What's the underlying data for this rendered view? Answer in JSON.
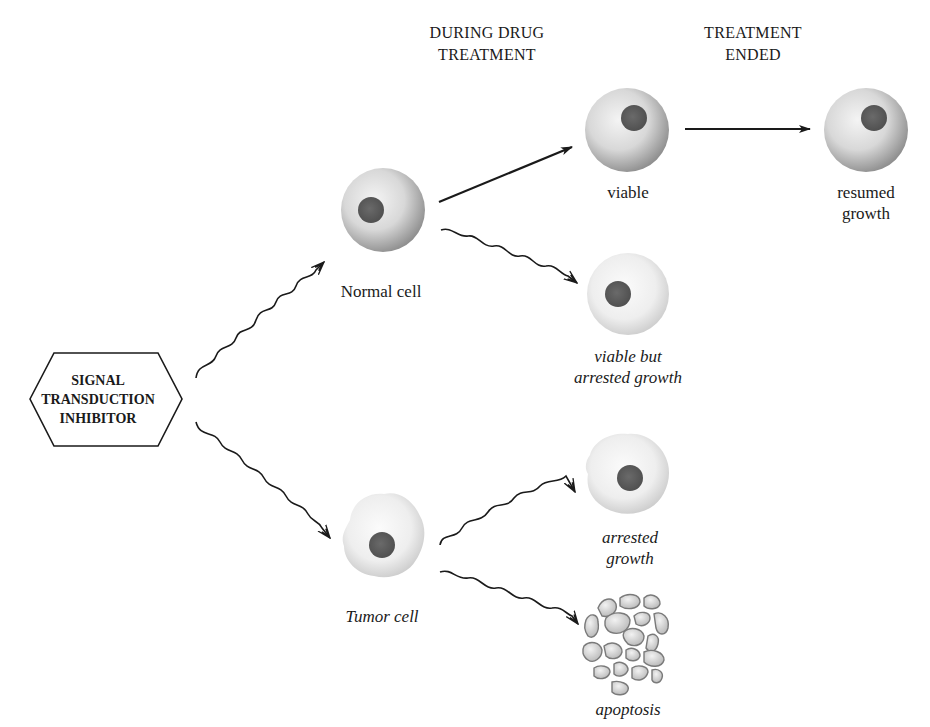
{
  "headers": {
    "during": [
      "DURING DRUG",
      "TREATMENT"
    ],
    "ended": [
      "TREATMENT",
      "ENDED"
    ]
  },
  "inhibitor": {
    "lines": [
      "SIGNAL",
      "TRANSDUCTION",
      "INHIBITOR"
    ]
  },
  "cells": {
    "normal": {
      "label": "Normal cell",
      "style": "upright"
    },
    "tumor": {
      "label": "Tumor cell",
      "style": "italic"
    },
    "viable": {
      "label": "viable",
      "style": "upright"
    },
    "resumed": {
      "label_lines": [
        "resumed",
        "growth"
      ],
      "style": "upright"
    },
    "viable_arrested": {
      "label_lines": [
        "viable but",
        "arrested growth"
      ],
      "style": "italic"
    },
    "tumor_arrested": {
      "label_lines": [
        "arrested",
        "growth"
      ],
      "style": "italic"
    },
    "apoptosis": {
      "label": "apoptosis",
      "style": "italic"
    }
  },
  "arrows": [
    {
      "from": "inhibitor",
      "to": "normal",
      "type": "wavy"
    },
    {
      "from": "inhibitor",
      "to": "tumor",
      "type": "wavy"
    },
    {
      "from": "normal",
      "to": "viable",
      "type": "straight"
    },
    {
      "from": "normal",
      "to": "viable_arrested",
      "type": "wavy"
    },
    {
      "from": "viable",
      "to": "resumed",
      "type": "straight"
    },
    {
      "from": "tumor",
      "to": "tumor_arrested",
      "type": "wavy"
    },
    {
      "from": "tumor",
      "to": "apoptosis",
      "type": "wavy"
    }
  ],
  "colors": {
    "cell_normal_edge": "#8a8a8a",
    "cell_normal_center": "#f2f2f2",
    "cell_pale_edge": "#cfcfcf",
    "nucleus": "#5a5a5a",
    "line": "#1a1a1a"
  }
}
